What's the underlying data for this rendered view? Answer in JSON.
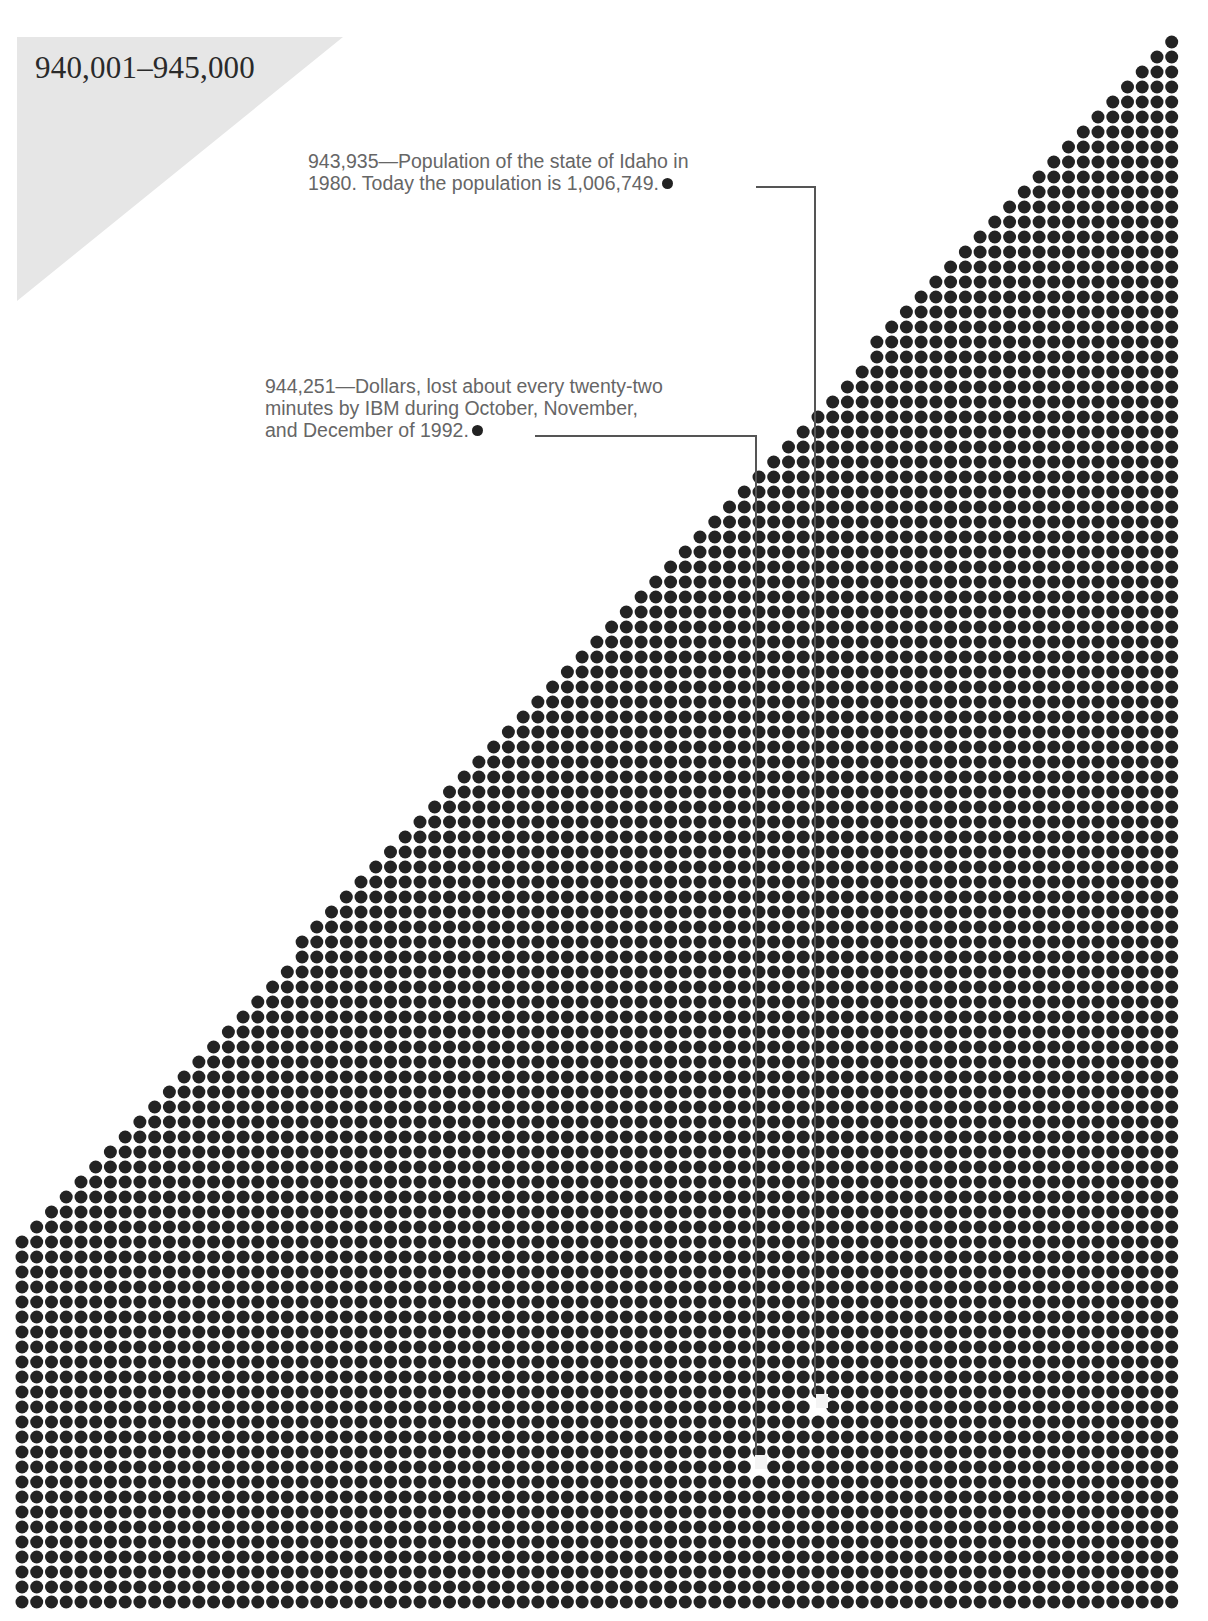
{
  "header": {
    "range_title": "940,001–945,000"
  },
  "annotations": [
    {
      "number": "943,935",
      "lines": [
        "943,935—Population of the state of Idaho in",
        "1980. Today the population is 1,006,749."
      ],
      "marker_dot_x": 740,
      "marker_dot_y": 186,
      "connector": {
        "x_start": 756,
        "y": 187,
        "x_end": 815,
        "y_end": 1395
      },
      "highlight_cell": {
        "x": 822,
        "y": 1401
      }
    },
    {
      "number": "944,251",
      "lines": [
        "944,251—Dollars, lost about every twenty-two",
        "minutes by IBM during October, November,",
        "and December of 1992."
      ],
      "marker_dot_x": 521,
      "marker_dot_y": 436,
      "connector": {
        "x_start": 535,
        "y": 436,
        "x_end": 756,
        "y_end": 1456
      },
      "highlight_cell": {
        "x": 761,
        "y": 1462
      }
    }
  ],
  "chart_data": {
    "type": "dot-matrix",
    "title": "940,001–945,000",
    "range_start": 940001,
    "range_end": 945000,
    "dot_count": 5000,
    "grid": {
      "columns": 79,
      "rows": 105,
      "staircase_rows": 81,
      "origin_x": 22,
      "origin_y": 42,
      "pitch_x": 14.74,
      "pitch_y": 15.0,
      "dot_diameter": 13
    },
    "highlighted_values": [
      {
        "value": 943935,
        "label": "Population of the state of Idaho in 1980. Today the population is 1,006,749."
      },
      {
        "value": 944251,
        "label": "Dollars, lost about every twenty-two minutes by IBM during October, November, and December of 1992."
      }
    ],
    "colors": {
      "dot": "#232323",
      "background": "#ffffff",
      "title_panel": "#e6e6e6",
      "annotation_text": "#666666",
      "connector": "#555555"
    }
  }
}
